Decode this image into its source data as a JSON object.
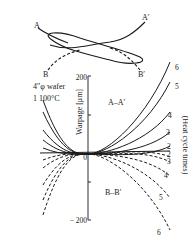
{
  "diagram": {
    "wafer_labels": {
      "a": "A",
      "a_prime": "A′",
      "b": "B",
      "b_prime": "B′"
    },
    "wafer_size": "4″φ wafer",
    "temperature": "1 100°C",
    "y_axis": {
      "label": "Warpage [μm]",
      "ticks": [
        "200",
        "0",
        "− 200"
      ]
    },
    "section_labels": {
      "upper": "A–A′",
      "lower": "B–B′"
    },
    "right_axis_label": "(Heat cycle times)",
    "upper_curve_labels": [
      "6",
      "5",
      "4",
      "3",
      "2"
    ],
    "lower_curve_labels": [
      "2",
      "3",
      "4",
      "5",
      "6"
    ],
    "line_color": "#1a1a1a"
  }
}
